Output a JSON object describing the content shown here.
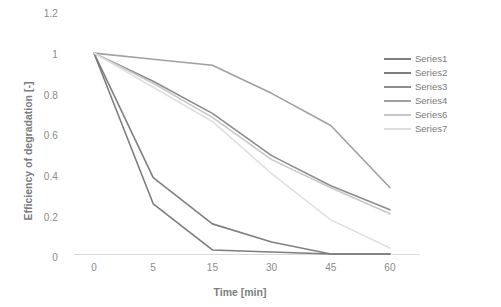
{
  "chart_data": {
    "type": "line",
    "title": "",
    "xlabel": "Time [min]",
    "ylabel": "Efficiency of degradation [-]",
    "x": [
      0,
      5,
      15,
      30,
      45,
      60
    ],
    "xticklabels": [
      "0",
      "5",
      "15",
      "30",
      "45",
      "60"
    ],
    "yticklabels": [
      "0",
      "0.2",
      "0.4",
      "0.6",
      "0.8",
      "1",
      "1.2"
    ],
    "ylim": [
      0,
      1.2
    ],
    "xlim": [
      0,
      60
    ],
    "grid": false,
    "legend_position": "right",
    "series": [
      {
        "name": "Series1",
        "color": "#808080",
        "values": [
          1,
          0.38,
          0.15,
          0.06,
          0,
          0
        ]
      },
      {
        "name": "Series2",
        "color": "#7d7d7d",
        "values": [
          1,
          0.25,
          0.02,
          0.01,
          0,
          0
        ]
      },
      {
        "name": "Series3",
        "color": "#8c8c8c",
        "values": [
          1,
          0.86,
          0.7,
          0.49,
          0.34,
          0.22
        ]
      },
      {
        "name": "Series4",
        "color": "#a0a0a0",
        "values": [
          1,
          0.97,
          0.94,
          0.8,
          0.64,
          0.33
        ]
      },
      {
        "name": "Series6",
        "color": "#c8c8c8",
        "values": [
          1,
          0.85,
          0.68,
          0.47,
          0.33,
          0.2
        ]
      },
      {
        "name": "Series7",
        "color": "#e0e0e0",
        "values": [
          1,
          0.83,
          0.66,
          0.4,
          0.17,
          0.03
        ]
      }
    ]
  },
  "axis": {
    "yticks": [
      {
        "label": "1.2",
        "top": 8
      },
      {
        "label": "1",
        "top": 49
      },
      {
        "label": "0.8",
        "top": 90
      },
      {
        "label": "0.6",
        "top": 130
      },
      {
        "label": "0.4",
        "top": 171
      },
      {
        "label": "0.2",
        "top": 212
      },
      {
        "label": "0",
        "top": 252
      }
    ],
    "xticks": [
      {
        "label": "0",
        "left": 74
      },
      {
        "label": "5",
        "left": 134
      },
      {
        "label": "15",
        "left": 212
      },
      {
        "label": "30",
        "left": 290
      },
      {
        "label": "45",
        "left": 337
      },
      {
        "label": "60",
        "left": 370
      }
    ]
  }
}
